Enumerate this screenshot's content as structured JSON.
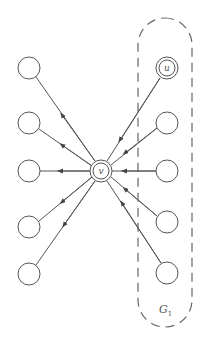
{
  "diagram": {
    "type": "directed-graph",
    "center_node": {
      "id": "v",
      "label": "v",
      "x": 101,
      "y": 171,
      "double": true
    },
    "special_node": {
      "id": "u",
      "label": "u",
      "x": 167,
      "y": 68,
      "double": true
    },
    "left_nodes": [
      {
        "id": "l1",
        "x": 29,
        "y": 68
      },
      {
        "id": "l2",
        "x": 29,
        "y": 123
      },
      {
        "id": "l3",
        "x": 29,
        "y": 171
      },
      {
        "id": "l4",
        "x": 29,
        "y": 227
      },
      {
        "id": "l5",
        "x": 29,
        "y": 274
      }
    ],
    "right_nodes": [
      {
        "id": "r2",
        "x": 167,
        "y": 123
      },
      {
        "id": "r3",
        "x": 167,
        "y": 171
      },
      {
        "id": "r4",
        "x": 167,
        "y": 222
      },
      {
        "id": "r5",
        "x": 167,
        "y": 273
      }
    ],
    "edges_note": "all right nodes (incl. u) point into v; v points out to all left nodes",
    "group": {
      "label": "G",
      "subscript": "1",
      "x": 138,
      "y": 18,
      "width": 54,
      "height": 309
    }
  },
  "colors": {
    "stroke": "#555555",
    "background": "#ffffff"
  }
}
